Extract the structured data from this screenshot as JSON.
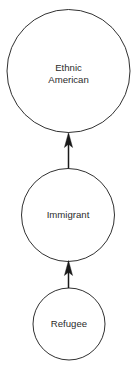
{
  "diagram": {
    "type": "flow-chain",
    "orientation": "bottom-to-top",
    "background_color": "#ffffff",
    "stroke_color": "#1a1a1a",
    "text_color": "#2b2b2b",
    "nodes": [
      {
        "id": "ethnic-american",
        "label": "Ethnic American",
        "label_line1": "Ethnic",
        "label_line2": "American",
        "shape": "circle",
        "cx": 68.5,
        "cy": 71,
        "r": 61.5
      },
      {
        "id": "immigrant",
        "label": "Immigrant",
        "label_line1": "Immigrant",
        "label_line2": "",
        "shape": "circle",
        "cx": 68,
        "cy": 215,
        "r": 46.5
      },
      {
        "id": "refugee",
        "label": "Refugee",
        "label_line1": "Refugee",
        "label_line2": "",
        "shape": "circle",
        "cx": 69,
        "cy": 324,
        "r": 36
      }
    ],
    "edges": [
      {
        "id": "immigrant-to-ethnic-american",
        "from": "immigrant",
        "to": "ethnic-american",
        "direction": "up",
        "arrowhead": "solid-triangle"
      },
      {
        "id": "refugee-to-immigrant",
        "from": "refugee",
        "to": "immigrant",
        "direction": "up",
        "arrowhead": "solid-triangle"
      }
    ]
  }
}
